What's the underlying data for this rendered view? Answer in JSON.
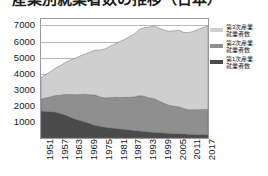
{
  "title": "産業別就業者数の推移（日本）",
  "chart_data": {
    "type": "area",
    "stacked": true,
    "title": "産業別就業者数の推移（日本）",
    "xlabel": "",
    "ylabel": "",
    "unit": "万人",
    "grid": true,
    "legend_position": "right",
    "ylim": [
      0,
      7400
    ],
    "yticks": [
      7000,
      6000,
      5000,
      4000,
      3000,
      2000,
      1000
    ],
    "xlim": [
      1951,
      2019
    ],
    "xticks": [
      1951,
      1957,
      1963,
      1969,
      1975,
      1981,
      1987,
      1993,
      1999,
      2005,
      2011,
      2017
    ],
    "x": [
      1951,
      1953,
      1955,
      1957,
      1959,
      1961,
      1963,
      1965,
      1967,
      1969,
      1971,
      1973,
      1975,
      1977,
      1979,
      1981,
      1983,
      1985,
      1987,
      1989,
      1991,
      1993,
      1995,
      1997,
      1999,
      2001,
      2003,
      2005,
      2007,
      2009,
      2011,
      2013,
      2015,
      2017,
      2019
    ],
    "series": [
      {
        "name": "第1次産業就業者数",
        "color": "#4a4a4a",
        "values": [
          1680,
          1660,
          1640,
          1610,
          1520,
          1430,
          1300,
          1180,
          1090,
          1000,
          900,
          790,
          730,
          680,
          640,
          600,
          570,
          540,
          510,
          470,
          440,
          410,
          380,
          360,
          340,
          310,
          290,
          280,
          270,
          260,
          240,
          230,
          220,
          215,
          210
        ]
      },
      {
        "name": "第2次産業就業者数",
        "color": "#8f8f8f",
        "values": [
          750,
          830,
          920,
          1030,
          1140,
          1280,
          1400,
          1510,
          1620,
          1720,
          1790,
          1880,
          1820,
          1810,
          1870,
          1930,
          1950,
          1990,
          2020,
          2080,
          2190,
          2190,
          2110,
          2090,
          1960,
          1850,
          1750,
          1690,
          1680,
          1570,
          1520,
          1520,
          1540,
          1560,
          1570
        ]
      },
      {
        "name": "第3次産業就業者数",
        "color": "#cfcfcf",
        "values": [
          1330,
          1460,
          1580,
          1720,
          1850,
          1990,
          2140,
          2280,
          2390,
          2510,
          2650,
          2800,
          2910,
          3040,
          3180,
          3310,
          3470,
          3600,
          3760,
          3920,
          4120,
          4260,
          4400,
          4520,
          4530,
          4560,
          4600,
          4680,
          4760,
          4740,
          4790,
          4880,
          4990,
          5100,
          5180
        ]
      }
    ]
  },
  "legend": {
    "items": [
      {
        "label": "第3次産業\n就業者数",
        "color": "#cfcfcf"
      },
      {
        "label": "第2次産業\n就業者数",
        "color": "#8f8f8f"
      },
      {
        "label": "第1次産業\n就業者数",
        "color": "#4a4a4a"
      }
    ]
  }
}
